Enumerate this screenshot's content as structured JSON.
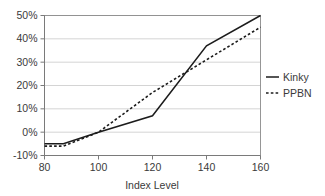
{
  "chart_data": {
    "type": "line",
    "title": "",
    "xlabel": "Index Level",
    "ylabel": "",
    "xlim": [
      80,
      160
    ],
    "ylim": [
      -10,
      50
    ],
    "grid": true,
    "legend_position": "right",
    "x_ticks": [
      80,
      100,
      120,
      140,
      160
    ],
    "x_tick_labels": [
      "80",
      "100",
      "120",
      "140",
      "160"
    ],
    "y_ticks": [
      -10,
      0,
      10,
      20,
      30,
      40,
      50
    ],
    "y_tick_labels": [
      "-10%",
      "0%",
      "10%",
      "20%",
      "30%",
      "40%",
      "50%"
    ],
    "series": [
      {
        "name": "Kinky",
        "style": "solid",
        "color": "#1c1c1c",
        "x": [
          80,
          87,
          100,
          120,
          140,
          160
        ],
        "values": [
          -5,
          -5,
          0,
          7,
          37,
          50
        ]
      },
      {
        "name": "PPBN",
        "style": "dotted",
        "color": "#1c1c1c",
        "x": [
          80,
          87,
          100,
          120,
          140,
          160
        ],
        "values": [
          -6,
          -6,
          0,
          17,
          31,
          45
        ]
      }
    ]
  },
  "axes": {
    "x_title": "Index Level"
  },
  "legend": {
    "entries": [
      {
        "label": "Kinky"
      },
      {
        "label": "PPBN"
      }
    ]
  }
}
